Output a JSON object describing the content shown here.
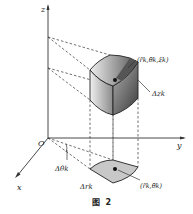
{
  "figure": {
    "caption": "图  2",
    "axes": {
      "z": "z",
      "y": "y",
      "x": "x",
      "origin": "O"
    },
    "labels": {
      "point_3d": "(r̄k,θ̄k,z̄k)",
      "delta_z": "Δzk",
      "delta_theta": "Δθk",
      "delta_r": "Δrk",
      "point_2d": "(r̄k,θ̄k)"
    },
    "colors": {
      "ink": "#222222",
      "base_fill": "#c8c8c8",
      "solid_light": "#e6e6e6",
      "solid_dark": "#4a4a4a"
    }
  }
}
